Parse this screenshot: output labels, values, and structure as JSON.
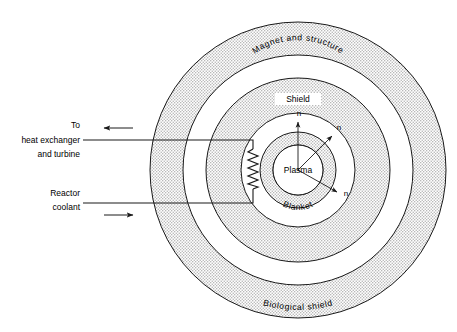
{
  "figure": {
    "type": "cross-section-schematic",
    "background_color": "#ffffff",
    "line_color": "#1a1a1a",
    "hatch_color": "#cfcfcf"
  },
  "center": {
    "x": 298,
    "y": 170
  },
  "rings": [
    {
      "id": "biological-shield",
      "label": "Biological shield",
      "outer_radius": 148,
      "inner_radius": 115,
      "filled": true,
      "label_placement": "arc-bottom"
    },
    {
      "id": "magnet-and-structure",
      "label": "Magnet and structure",
      "outer_radius": 92,
      "inner_radius": 57,
      "filled": true,
      "label_placement": "arc-top"
    },
    {
      "id": "shield-blanket",
      "label_outer": "Shield",
      "label_inner": "Blanket",
      "outer_radius": 38,
      "inner_radius": 25,
      "filled": true,
      "label_placement": "horizontal-top-and-arc-bottom"
    },
    {
      "id": "plasma",
      "label": "Plasma",
      "outer_radius": 25,
      "filled": false,
      "label_placement": "center"
    }
  ],
  "neutron_arrows": [
    {
      "id": "neutron-up",
      "label": "n",
      "angle_deg": 90,
      "label_x": 299,
      "label_y": 116
    },
    {
      "id": "neutron-upper-right",
      "label": "n",
      "angle_deg": 42,
      "label_x": 338,
      "label_y": 128
    },
    {
      "id": "neutron-lower-right",
      "label": "n",
      "angle_deg": -38,
      "label_x": 345,
      "label_y": 196
    }
  ],
  "coolant_loop": {
    "coil_label": "heat-exchanger-coil",
    "outlet": {
      "id": "to-heat-exchanger",
      "lines": [
        "To",
        "heat exchanger",
        "and turbine"
      ],
      "flow_direction": "left",
      "pipe_y": 140
    },
    "inlet": {
      "id": "reactor-coolant",
      "lines": [
        "Reactor",
        "coolant"
      ],
      "flow_direction": "right",
      "pipe_y": 203
    },
    "pipe_start_x": 83,
    "pipe_end_x": 253
  }
}
